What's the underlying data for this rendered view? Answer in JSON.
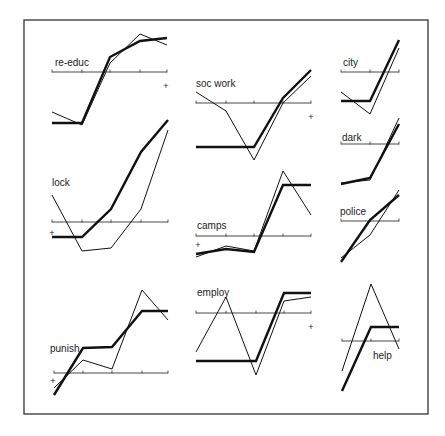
{
  "chart_data": {
    "type": "line",
    "title": "",
    "layout": "small multiples, 10 panels, each with a horizontal reference axis and two series (thick and thin)",
    "legend": "none",
    "grid": false,
    "colors": {
      "line": "#111111",
      "frame": "#333333",
      "background": "#ffffff"
    },
    "series_styles": [
      {
        "name": "thick",
        "stroke_width": 2.4
      },
      {
        "name": "thin",
        "stroke_width": 1.0
      }
    ],
    "panels": [
      {
        "label": "re-educ",
        "plus_marker": "right",
        "axis_y": 72,
        "label_pos": [
          55,
          66
        ],
        "plus_pos": [
          166,
          89
        ],
        "x": [
          52,
          82,
          110,
          140,
          167
        ],
        "thick": [
          123,
          123,
          57,
          41,
          38
        ],
        "thin": [
          112,
          125,
          63,
          34,
          45
        ]
      },
      {
        "label": "soc work",
        "plus_marker": "right",
        "axis_y": 103,
        "label_pos": [
          196,
          87
        ],
        "plus_pos": [
          311,
          120
        ],
        "x": [
          196,
          226,
          254,
          283,
          311
        ],
        "thick": [
          147,
          147,
          147,
          98,
          70
        ],
        "thin": [
          92,
          111,
          160,
          103,
          76
        ]
      },
      {
        "label": "city",
        "plus_marker": "none",
        "axis_y": 72,
        "label_pos": [
          343,
          66
        ],
        "x": [
          341,
          370,
          399
        ],
        "thick": [
          101,
          101,
          40
        ],
        "thin": [
          92,
          114,
          48
        ]
      },
      {
        "label": "lock",
        "plus_marker": "left",
        "axis_y": 222,
        "label_pos": [
          52,
          186
        ],
        "plus_pos": [
          52,
          236
        ],
        "x": [
          52,
          82,
          111,
          141,
          168
        ],
        "thick": [
          237,
          237,
          209,
          152,
          120
        ],
        "thin": [
          195,
          251,
          248,
          209,
          130
        ]
      },
      {
        "label": "camps",
        "plus_marker": "left",
        "axis_y": 236,
        "label_pos": [
          197,
          229
        ],
        "plus_pos": [
          198,
          248
        ],
        "x": [
          196,
          226,
          254,
          283,
          311
        ],
        "thick": [
          254,
          249,
          252,
          185,
          185
        ],
        "thin": [
          257,
          246,
          251,
          171,
          215
        ]
      },
      {
        "label": "dark",
        "plus_marker": "none",
        "axis_y": 144,
        "label_pos": [
          342,
          141
        ],
        "x": [
          341,
          370,
          399
        ],
        "thick": [
          184,
          178,
          124
        ],
        "thin": [
          183,
          180,
          118
        ]
      },
      {
        "label": "police",
        "plus_marker": "none",
        "axis_y": 221,
        "label_pos": [
          340,
          215
        ],
        "x": [
          341,
          370,
          399
        ],
        "thick": [
          262,
          220,
          195
        ],
        "thin": [
          258,
          235,
          190
        ]
      },
      {
        "label": "punish",
        "plus_marker": "left",
        "axis_y": 373,
        "label_pos": [
          50,
          352
        ],
        "plus_pos": [
          53,
          384
        ],
        "x": [
          54,
          83,
          112,
          142,
          168
        ],
        "thick": [
          395,
          348,
          347,
          311,
          311
        ],
        "thin": [
          388,
          360,
          369,
          290,
          320
        ]
      },
      {
        "label": "employ",
        "plus_marker": "right",
        "axis_y": 313,
        "label_pos": [
          197,
          296
        ],
        "plus_pos": [
          311,
          330
        ],
        "x": [
          196,
          226,
          256,
          284,
          311
        ],
        "thick": [
          361,
          361,
          361,
          293,
          293
        ],
        "thin": [
          352,
          297,
          375,
          301,
          297
        ]
      },
      {
        "label": "help",
        "plus_marker": "none",
        "axis_y": 341,
        "label_pos": [
          373,
          359
        ],
        "x": [
          342,
          371,
          399
        ],
        "thick": [
          391,
          327,
          327
        ],
        "thin": [
          371,
          284,
          349
        ]
      }
    ],
    "frame": {
      "x": 24,
      "y": 20,
      "width": 404,
      "height": 394
    }
  }
}
